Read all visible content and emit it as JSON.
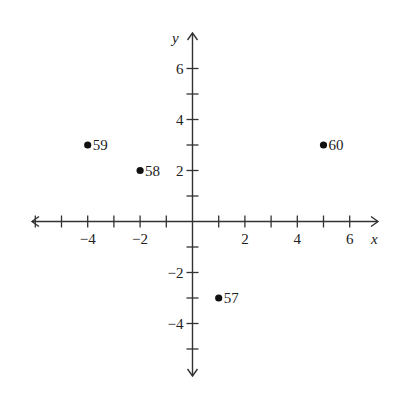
{
  "chart_data": {
    "type": "scatter",
    "title": "",
    "xlabel": "x",
    "ylabel": "y",
    "xlim": [
      -6.3,
      7.2
    ],
    "ylim": [
      -6.1,
      7.3
    ],
    "grid": false,
    "x_ticks": [
      -6,
      -5,
      -4,
      -3,
      -2,
      -1,
      1,
      2,
      3,
      4,
      5,
      6
    ],
    "x_tick_labels": [
      {
        "value": -4,
        "label": "−4"
      },
      {
        "value": -2,
        "label": "−2"
      },
      {
        "value": 2,
        "label": "2"
      },
      {
        "value": 4,
        "label": "4"
      },
      {
        "value": 6,
        "label": "6"
      }
    ],
    "y_ticks": [
      -5,
      -4,
      -3,
      -2,
      -1,
      1,
      2,
      3,
      4,
      5,
      6
    ],
    "y_tick_labels": [
      {
        "value": 6,
        "label": "6"
      },
      {
        "value": 4,
        "label": "4"
      },
      {
        "value": 2,
        "label": "2"
      },
      {
        "value": -2,
        "label": "−2"
      },
      {
        "value": -4,
        "label": "−4"
      }
    ],
    "points": [
      {
        "label": "59",
        "x": -4,
        "y": 3
      },
      {
        "label": "58",
        "x": -2,
        "y": 2
      },
      {
        "label": "60",
        "x": 5,
        "y": 3
      },
      {
        "label": "57",
        "x": 1,
        "y": -3
      }
    ]
  },
  "axes": {
    "x_label": "x",
    "y_label": "y"
  }
}
